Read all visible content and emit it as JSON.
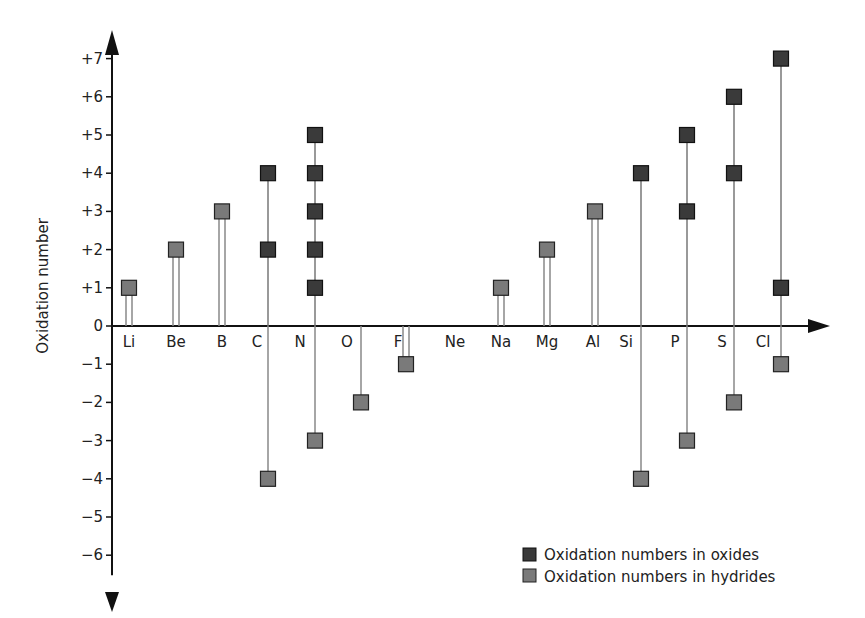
{
  "header": {
    "partial_text": "ng ... y"
  },
  "chart_data": {
    "type": "scatter",
    "title": "",
    "xlabel": "",
    "ylabel": "Oxidation number",
    "ylim": [
      -6,
      7
    ],
    "grid": false,
    "legend_position": "lower right",
    "categories": [
      "Li",
      "Be",
      "B",
      "C",
      "N",
      "O",
      "F",
      "Ne",
      "Na",
      "Mg",
      "Al",
      "Si",
      "P",
      "S",
      "Cl"
    ],
    "y_ticks": [
      "+7",
      "+6",
      "+5",
      "+4",
      "+3",
      "+2",
      "+1",
      "0",
      "-1",
      "-2",
      "-3",
      "-4",
      "-5",
      "-6"
    ],
    "series": [
      {
        "name": "Oxidation numbers in oxides",
        "color": "#3a3a3a",
        "points": [
          {
            "element": "C",
            "values": [
              2,
              4
            ]
          },
          {
            "element": "N",
            "values": [
              1,
              2,
              3,
              4,
              5
            ]
          },
          {
            "element": "Si",
            "values": [
              4
            ]
          },
          {
            "element": "P",
            "values": [
              3,
              5
            ]
          },
          {
            "element": "S",
            "values": [
              4,
              6
            ]
          },
          {
            "element": "Cl",
            "values": [
              1,
              7
            ]
          }
        ]
      },
      {
        "name": "Oxidation numbers in hydrides",
        "color": "#7a7a7a",
        "points": [
          {
            "element": "Li",
            "values": [
              1
            ]
          },
          {
            "element": "Be",
            "values": [
              2
            ]
          },
          {
            "element": "B",
            "values": [
              3
            ]
          },
          {
            "element": "C",
            "values": [
              -4
            ]
          },
          {
            "element": "N",
            "values": [
              -3
            ]
          },
          {
            "element": "O",
            "values": [
              -2
            ]
          },
          {
            "element": "F",
            "values": [
              -1
            ]
          },
          {
            "element": "Na",
            "values": [
              1
            ]
          },
          {
            "element": "Mg",
            "values": [
              2
            ]
          },
          {
            "element": "Al",
            "values": [
              3
            ]
          },
          {
            "element": "Si",
            "values": [
              -4
            ]
          },
          {
            "element": "P",
            "values": [
              -3
            ]
          },
          {
            "element": "S",
            "values": [
              -2
            ]
          },
          {
            "element": "Cl",
            "values": [
              -1
            ]
          }
        ]
      }
    ]
  },
  "legend": {
    "oxides": "Oxidation numbers in oxides",
    "hydrides": "Oxidation numbers in hydrides"
  }
}
